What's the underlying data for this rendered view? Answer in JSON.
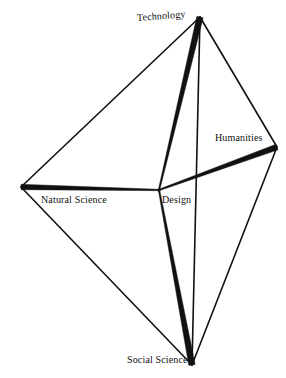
{
  "figure": {
    "type": "radial-spoke-diagram",
    "background_color": "#ffffff",
    "line_color": "#111111",
    "center": {
      "id": "design",
      "label": "Design",
      "x": 159,
      "y": 190
    },
    "vertices": [
      {
        "id": "technology",
        "label": "Technology",
        "x": 200,
        "y": 17,
        "label_x": 137,
        "label_y": 12,
        "label_rotation": -4.5
      },
      {
        "id": "humanities",
        "label": "Humanities",
        "x": 277,
        "y": 147,
        "label_x": 215,
        "label_y": 132,
        "label_rotation": 0
      },
      {
        "id": "social-science",
        "label": "Social Science",
        "x": 192,
        "y": 365,
        "label_x": 127,
        "label_y": 354,
        "label_rotation": 0
      },
      {
        "id": "natural-science",
        "label": "Natural Science",
        "x": 21,
        "y": 187,
        "label_x": 41,
        "label_y": 194,
        "label_rotation": 0
      }
    ],
    "outline_edges": [
      {
        "from": "technology",
        "to": "humanities"
      },
      {
        "from": "humanities",
        "to": "social-science"
      },
      {
        "from": "social-science",
        "to": "natural-science"
      },
      {
        "from": "natural-science",
        "to": "technology"
      },
      {
        "from": "technology",
        "to": "social-science"
      }
    ],
    "spokes": [
      {
        "id": "spoke-design-technology",
        "to": "technology",
        "max_width": 6.5
      },
      {
        "id": "spoke-design-humanities",
        "to": "humanities",
        "max_width": 6.0
      },
      {
        "id": "spoke-design-social-science",
        "to": "social-science",
        "max_width": 6.5
      },
      {
        "id": "spoke-design-natural-science",
        "to": "natural-science",
        "max_width": 5.5
      }
    ],
    "outline_stroke_width": 1.6,
    "center_dot_radius": 1.6
  }
}
